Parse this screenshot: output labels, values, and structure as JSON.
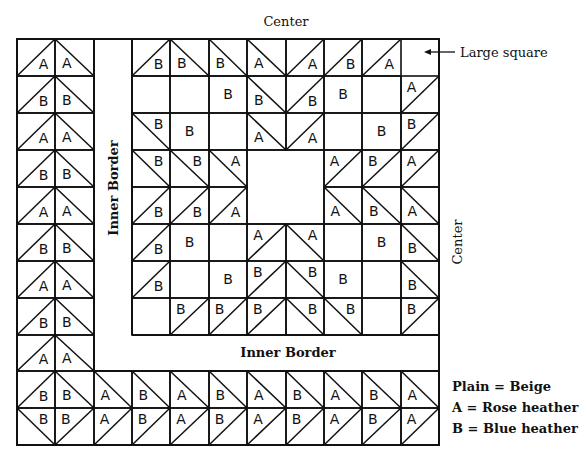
{
  "labels": {
    "center_top": "Center",
    "center_right": "Center",
    "inner_border_vertical": "Inner Border",
    "inner_border_horizontal": "Inner Border",
    "large_square": "Large square"
  },
  "legend": [
    {
      "key": "Plain",
      "value": "Beige"
    },
    {
      "key": "A",
      "value": "Rose heather"
    },
    {
      "key": "B",
      "value": "Blue heather"
    }
  ],
  "colors": {
    "line": "#111111",
    "background": "#ffffff"
  },
  "grid": {
    "cols_x": [
      17,
      55,
      94,
      132,
      170,
      209,
      247,
      286,
      324,
      362,
      401,
      439
    ],
    "main_rows_y": [
      39,
      76,
      113,
      150,
      187,
      224,
      261,
      298,
      335
    ],
    "left_rows_y": [
      39,
      76,
      113,
      150,
      187,
      224,
      261,
      298,
      335,
      371
    ],
    "bottom_rows_y": [
      371,
      408,
      445
    ]
  },
  "left_border": [
    [
      "A",
      "A"
    ],
    [
      "B",
      "B"
    ],
    [
      "A",
      "A"
    ],
    [
      "B",
      "B"
    ],
    [
      "A",
      "A"
    ],
    [
      "B",
      "B"
    ],
    [
      "A",
      "A"
    ],
    [
      "B",
      "B"
    ],
    [
      "A",
      "A"
    ]
  ],
  "main_center": [
    [
      {
        "d": "/",
        "l": "B",
        "p": "br"
      },
      {
        "d": "\\",
        "l": "B",
        "p": "bl"
      },
      {
        "d": "\\",
        "l": "B",
        "p": "bl"
      },
      {
        "d": "\\",
        "l": "A",
        "p": "bl"
      },
      {
        "d": "/",
        "l": "A",
        "p": "br"
      },
      {
        "d": "/",
        "l": "B",
        "p": "br"
      },
      {
        "d": "/",
        "l": "A",
        "p": "br"
      },
      {
        "d": "dashed"
      }
    ],
    [
      {
        "d": ""
      },
      {
        "d": ""
      },
      {
        "d": "",
        "l": "B",
        "p": "c"
      },
      {
        "d": "\\",
        "l": "B",
        "p": "bl"
      },
      {
        "d": "/",
        "l": "B",
        "p": "br"
      },
      {
        "d": "",
        "l": "B",
        "p": "c"
      },
      {
        "d": ""
      },
      {
        "d": "/",
        "l": "A",
        "p": "tl"
      }
    ],
    [
      {
        "d": "\\",
        "l": "B",
        "p": "tr"
      },
      {
        "d": "",
        "l": "B",
        "p": "c"
      },
      {
        "d": ""
      },
      {
        "d": "\\",
        "l": "A",
        "p": "bl"
      },
      {
        "d": "/",
        "l": "A",
        "p": "br"
      },
      {
        "d": ""
      },
      {
        "d": "",
        "l": "B",
        "p": "c"
      },
      {
        "d": "/",
        "l": "B",
        "p": "tl"
      }
    ],
    [
      {
        "d": "\\",
        "l": "B",
        "p": "tr"
      },
      {
        "d": "\\",
        "l": "B",
        "p": "tr"
      },
      {
        "d": "\\",
        "l": "A",
        "p": "tr"
      },
      {
        "d": "center"
      },
      {
        "d": "center"
      },
      {
        "d": "/",
        "l": "A",
        "p": "tl"
      },
      {
        "d": "/",
        "l": "B",
        "p": "tl"
      },
      {
        "d": "/",
        "l": "A",
        "p": "tl"
      }
    ],
    [
      {
        "d": "/",
        "l": "B",
        "p": "br"
      },
      {
        "d": "/",
        "l": "B",
        "p": "br"
      },
      {
        "d": "/",
        "l": "A",
        "p": "br"
      },
      {
        "d": "center"
      },
      {
        "d": "center"
      },
      {
        "d": "\\",
        "l": "A",
        "p": "bl"
      },
      {
        "d": "\\",
        "l": "B",
        "p": "bl"
      },
      {
        "d": "\\",
        "l": "A",
        "p": "bl"
      }
    ],
    [
      {
        "d": "/",
        "l": "B",
        "p": "br"
      },
      {
        "d": "",
        "l": "B",
        "p": "c"
      },
      {
        "d": ""
      },
      {
        "d": "/",
        "l": "A",
        "p": "tl"
      },
      {
        "d": "\\",
        "l": "A",
        "p": "tr"
      },
      {
        "d": ""
      },
      {
        "d": "",
        "l": "B",
        "p": "c"
      },
      {
        "d": "\\",
        "l": "B",
        "p": "bl"
      }
    ],
    [
      {
        "d": "/",
        "l": "B",
        "p": "br"
      },
      {
        "d": ""
      },
      {
        "d": "",
        "l": "B",
        "p": "c"
      },
      {
        "d": "/",
        "l": "B",
        "p": "tl"
      },
      {
        "d": "\\",
        "l": "B",
        "p": "tr"
      },
      {
        "d": "",
        "l": "B",
        "p": "c"
      },
      {
        "d": ""
      },
      {
        "d": "\\",
        "l": "B",
        "p": "bl"
      }
    ],
    [
      {
        "d": ""
      },
      {
        "d": "/",
        "l": "B",
        "p": "tl"
      },
      {
        "d": "/",
        "l": "B",
        "p": "tl"
      },
      {
        "d": "/",
        "l": "B",
        "p": "tl"
      },
      {
        "d": "\\",
        "l": "B",
        "p": "tr"
      },
      {
        "d": "\\",
        "l": "B",
        "p": "tr"
      },
      {
        "d": ""
      },
      {
        "d": "/",
        "l": "B",
        "p": "tl"
      }
    ]
  ],
  "bottom_border": [
    [
      {
        "d": "/",
        "l": "B",
        "p": "br"
      },
      {
        "d": "\\",
        "l": "B",
        "p": "bl"
      },
      {
        "d": "\\",
        "l": "A",
        "p": "bl"
      },
      {
        "d": "\\",
        "l": "B",
        "p": "bl"
      },
      {
        "d": "\\",
        "l": "A",
        "p": "bl"
      },
      {
        "d": "\\",
        "l": "B",
        "p": "bl"
      },
      {
        "d": "\\",
        "l": "A",
        "p": "bl"
      },
      {
        "d": "\\",
        "l": "B",
        "p": "bl"
      },
      {
        "d": "\\",
        "l": "A",
        "p": "bl"
      },
      {
        "d": "\\",
        "l": "B",
        "p": "bl"
      },
      {
        "d": "\\",
        "l": "A",
        "p": "bl"
      }
    ],
    [
      {
        "d": "\\",
        "l": "B",
        "p": "tr"
      },
      {
        "d": "/",
        "l": "B",
        "p": "tl"
      },
      {
        "d": "/",
        "l": "A",
        "p": "tl"
      },
      {
        "d": "/",
        "l": "B",
        "p": "tl"
      },
      {
        "d": "/",
        "l": "A",
        "p": "tl"
      },
      {
        "d": "/",
        "l": "B",
        "p": "tl"
      },
      {
        "d": "/",
        "l": "A",
        "p": "tl"
      },
      {
        "d": "/",
        "l": "B",
        "p": "tl"
      },
      {
        "d": "/",
        "l": "A",
        "p": "tl"
      },
      {
        "d": "/",
        "l": "B",
        "p": "tl"
      },
      {
        "d": "/",
        "l": "A",
        "p": "tl"
      }
    ]
  ]
}
